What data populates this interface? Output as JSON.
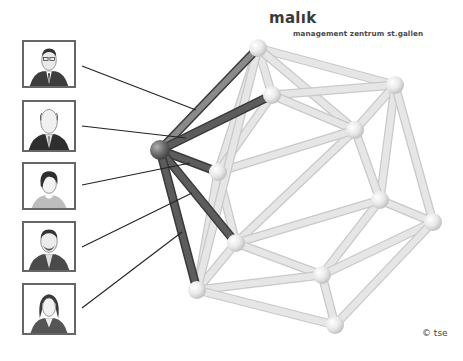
{
  "logo": {
    "name": "malık",
    "subtitle": "management zentrum st.gallen"
  },
  "copyright": "© tse",
  "colors": {
    "background": "#ffffff",
    "light_rod": "#e6e6e6",
    "light_rod_edge": "#c9c9c9",
    "dark_rod": "#5c5c5c",
    "mid_rod": "#8a8a8a",
    "connector_line": "#222222",
    "portrait_border": "#666666"
  },
  "portraits": [
    {
      "id": 1,
      "subject": "man-with-glasses-suit",
      "top": 40,
      "height": 48
    },
    {
      "id": 2,
      "subject": "bald-man-suit",
      "top": 100,
      "height": 52
    },
    {
      "id": 3,
      "subject": "woman-short-hair",
      "top": 162,
      "height": 48
    },
    {
      "id": 4,
      "subject": "man-with-beard-suit",
      "top": 221,
      "height": 51
    },
    {
      "id": 5,
      "subject": "woman-long-hair-blazer",
      "top": 283,
      "height": 52
    }
  ],
  "connectors": [
    {
      "from": [
        82,
        66
      ],
      "to": [
        196,
        110
      ]
    },
    {
      "from": [
        82,
        126
      ],
      "to": [
        186,
        138
      ]
    },
    {
      "from": [
        82,
        185
      ],
      "to": [
        190,
        163
      ]
    },
    {
      "from": [
        82,
        247
      ],
      "to": [
        192,
        193
      ]
    },
    {
      "from": [
        82,
        308
      ],
      "to": [
        182,
        232
      ]
    }
  ],
  "icosahedron": {
    "vertices": {
      "A": [
        160,
        150
      ],
      "B": [
        258,
        48
      ],
      "C": [
        272,
        95
      ],
      "D": [
        395,
        85
      ],
      "E": [
        355,
        130
      ],
      "F": [
        218,
        172
      ],
      "G": [
        380,
        200
      ],
      "H": [
        433,
        222
      ],
      "I": [
        236,
        243
      ],
      "J": [
        322,
        275
      ],
      "K": [
        197,
        290
      ],
      "L": [
        335,
        325
      ]
    },
    "highlighted_edges": [
      [
        "A",
        "B"
      ],
      [
        "A",
        "C"
      ],
      [
        "A",
        "F"
      ],
      [
        "A",
        "I"
      ],
      [
        "A",
        "K"
      ]
    ],
    "edges": [
      [
        "B",
        "C"
      ],
      [
        "B",
        "D"
      ],
      [
        "B",
        "E"
      ],
      [
        "B",
        "F"
      ],
      [
        "C",
        "D"
      ],
      [
        "C",
        "E"
      ],
      [
        "C",
        "F"
      ],
      [
        "D",
        "E"
      ],
      [
        "D",
        "G"
      ],
      [
        "D",
        "H"
      ],
      [
        "E",
        "G"
      ],
      [
        "E",
        "I"
      ],
      [
        "E",
        "F"
      ],
      [
        "F",
        "I"
      ],
      [
        "F",
        "K"
      ],
      [
        "G",
        "H"
      ],
      [
        "G",
        "J"
      ],
      [
        "G",
        "I"
      ],
      [
        "H",
        "J"
      ],
      [
        "H",
        "L"
      ],
      [
        "I",
        "J"
      ],
      [
        "I",
        "K"
      ],
      [
        "J",
        "L"
      ],
      [
        "J",
        "K"
      ],
      [
        "K",
        "L"
      ],
      [
        "B",
        "K"
      ]
    ]
  }
}
